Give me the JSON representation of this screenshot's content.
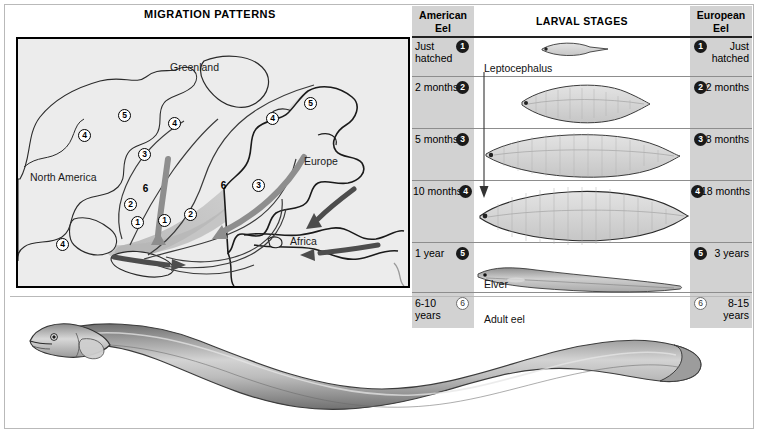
{
  "map": {
    "title": "MIGRATION PATTERNS",
    "labels": [
      {
        "text": "Greenland",
        "x": 163,
        "y": 59
      },
      {
        "text": "North America",
        "x": 22,
        "y": 168
      },
      {
        "text": "Europe",
        "x": 295,
        "y": 152
      },
      {
        "text": "Africa",
        "x": 280,
        "y": 232
      }
    ],
    "markers": [
      {
        "n": "5",
        "x": 106,
        "y": 106
      },
      {
        "n": "4",
        "x": 156,
        "y": 114
      },
      {
        "n": "5",
        "x": 292,
        "y": 94
      },
      {
        "n": "4",
        "x": 254,
        "y": 109
      },
      {
        "n": "4",
        "x": 66,
        "y": 126
      },
      {
        "n": "3",
        "x": 126,
        "y": 145
      },
      {
        "n": "3",
        "x": 240,
        "y": 176
      },
      {
        "n": "2",
        "x": 112,
        "y": 195
      },
      {
        "n": "2",
        "x": 172,
        "y": 205
      },
      {
        "n": "6",
        "x": 127,
        "y": 189
      },
      {
        "n": "6",
        "x": 205,
        "y": 186
      },
      {
        "n": "1",
        "x": 119,
        "y": 213
      },
      {
        "n": "1",
        "x": 146,
        "y": 211
      },
      {
        "n": "4",
        "x": 44,
        "y": 235
      }
    ]
  },
  "table": {
    "headers": {
      "american": "American\nEel",
      "american_line1": "American",
      "american_line2": "Eel",
      "middle": "LARVAL STAGES",
      "european_line1": "European",
      "european_line2": "Eel"
    },
    "rows": [
      {
        "stage": "1",
        "american": "Just\nhatched",
        "american_l1": "Just",
        "american_l2": "hatched",
        "european_l1": "Just",
        "european_l2": "hatched",
        "hollow": false
      },
      {
        "stage": "2",
        "american_l1": "2 months",
        "american_l2": "",
        "european_l1": "2 months",
        "european_l2": "",
        "hollow": false
      },
      {
        "stage": "3",
        "american_l1": "5 months",
        "american_l2": "",
        "european_l1": "8 months",
        "european_l2": "",
        "hollow": false
      },
      {
        "stage": "4",
        "american_l1": "10 months",
        "american_l2": "",
        "european_l1": "18 months",
        "european_l2": "",
        "hollow": false
      },
      {
        "stage": "5",
        "american_l1": "1 year",
        "american_l2": "",
        "european_l1": "3 years",
        "european_l2": "",
        "hollow": false
      },
      {
        "stage": "6",
        "american_l1": "6-10",
        "american_l2": "years",
        "european_l1": "8-15",
        "european_l2": "years",
        "hollow": true
      }
    ],
    "captions": [
      {
        "text": "Leptocephalus",
        "x": 72,
        "y": 56
      },
      {
        "text": "Elver",
        "x": 72,
        "y": 272
      },
      {
        "text": "Adult eel",
        "x": 72,
        "y": 310
      }
    ]
  },
  "colors": {
    "panel_gray": "#d2d2d2",
    "map_sea": "#ececec",
    "rule": "#8d8d8d",
    "ink": "#1a1a1a",
    "larva_body": "#c9c9c9"
  }
}
